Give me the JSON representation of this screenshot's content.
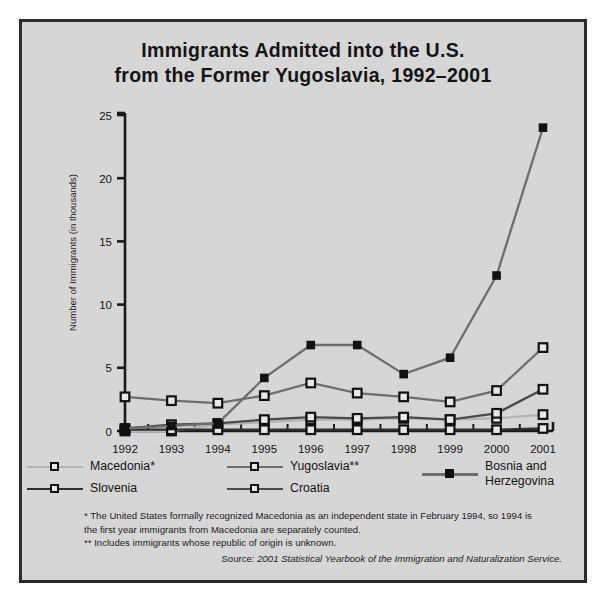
{
  "title": {
    "line1": "Immigrants Admitted into the U.S.",
    "line2": "from the Former Yugoslavia, 1992–2001"
  },
  "axis": {
    "ylabel": "Number of Immigrants (in thousands)",
    "yticks": [
      "0",
      "5",
      "10",
      "15",
      "20",
      "25"
    ],
    "xticks": [
      "1992",
      "1993",
      "1994",
      "1995",
      "1996",
      "1997",
      "1998",
      "1999",
      "2000",
      "2001"
    ]
  },
  "legend": {
    "items": [
      {
        "label": "Macedonia*",
        "color": "#b4b4b4",
        "marker": "open"
      },
      {
        "label": "Yugoslavia**",
        "color": "#6e6e6e",
        "marker": "open"
      },
      {
        "label": "Bosnia and\nHerzegovina",
        "color": "#6e6e6e",
        "marker": "filled"
      },
      {
        "label": "Slovenia",
        "color": "#303030",
        "marker": "open"
      },
      {
        "label": "Croatia",
        "color": "#4a4a4a",
        "marker": "open"
      }
    ]
  },
  "notes": {
    "note1": "* The United States formally recognized Macedonia as an independent state in February 1994, so 1994 is the first year immigrants from Macedonia are separately counted.",
    "note2": "** Includes immigrants whose republic of origin is unknown."
  },
  "source": {
    "prefix": "Source: ",
    "text": "2001 Statistical Yearbook of the Immigration and Naturalization Service."
  },
  "colors": {
    "background": "#d6d6d6",
    "frame": "#2b2b2b",
    "axis": "#1a1a1a"
  },
  "chart_data": {
    "type": "line",
    "title": "Immigrants Admitted into the U.S. from the Former Yugoslavia, 1992–2001",
    "xlabel": "",
    "ylabel": "Number of Immigrants (in thousands)",
    "categories": [
      "1992",
      "1993",
      "1994",
      "1995",
      "1996",
      "1997",
      "1998",
      "1999",
      "2000",
      "2001"
    ],
    "ylim": [
      0,
      25
    ],
    "yticks": [
      0,
      5,
      10,
      15,
      20,
      25
    ],
    "grid": false,
    "legend_position": "bottom",
    "series": [
      {
        "name": "Bosnia and Herzegovina",
        "color": "#6e6e6e",
        "marker": "filled",
        "values": [
          0.2,
          0.4,
          0.6,
          4.2,
          6.8,
          6.8,
          4.5,
          5.8,
          12.3,
          24.0
        ]
      },
      {
        "name": "Yugoslavia**",
        "color": "#6e6e6e",
        "marker": "open",
        "values": [
          2.7,
          2.4,
          2.2,
          2.8,
          3.8,
          3.0,
          2.7,
          2.3,
          3.2,
          6.6
        ]
      },
      {
        "name": "Croatia",
        "color": "#4a4a4a",
        "marker": "open",
        "values": [
          0.2,
          0.5,
          0.6,
          0.9,
          1.1,
          1.0,
          1.1,
          0.9,
          1.4,
          3.3
        ]
      },
      {
        "name": "Macedonia*",
        "color": "#b4b4b4",
        "marker": "open",
        "values": [
          0.0,
          0.0,
          0.5,
          0.7,
          0.9,
          0.9,
          1.0,
          0.9,
          1.0,
          1.3
        ]
      },
      {
        "name": "Slovenia",
        "color": "#303030",
        "marker": "open",
        "values": [
          0.1,
          0.1,
          0.1,
          0.1,
          0.1,
          0.1,
          0.1,
          0.1,
          0.1,
          0.2
        ]
      }
    ]
  }
}
